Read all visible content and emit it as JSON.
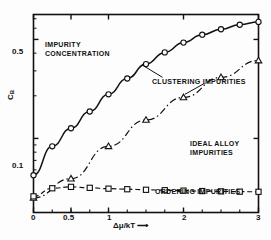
{
  "chart_data": {
    "type": "line",
    "title": "",
    "annotations": [
      {
        "id": "impurity-concentration",
        "text_line1": "IMPURITY",
        "text_line2": "CONCENTRATION",
        "x": 45,
        "y": 40
      },
      {
        "id": "clustering-impurities",
        "text_line1": "CLUSTERING IMPURITIES",
        "text_line2": "",
        "x": 152,
        "y": 77
      },
      {
        "id": "ideal-alloy-impurities",
        "text_line1": "IDEAL ALLOY",
        "text_line2": "IMPURITIES",
        "x": 190,
        "y": 140
      },
      {
        "id": "ordering-impurities",
        "text_line1": "ORDERING IMPURITIES",
        "text_line2": "",
        "x": 155,
        "y": 187
      }
    ],
    "xlabel": "Δμ/kT ⟶",
    "ylabel": "C",
    "ylabel_sub": "B",
    "xlim": [
      0,
      3
    ],
    "ylim_log": [
      0.03,
      0.75
    ],
    "yscale": "log",
    "xticks": [
      0,
      0.5,
      1,
      2,
      3
    ],
    "xtick_labels": [
      "0",
      "0.5",
      "1",
      "2",
      "3"
    ],
    "yticks": [
      0.1,
      0.5
    ],
    "ytick_labels": [
      "0.1",
      "0.5"
    ],
    "grid": false,
    "legend": "none (inline annotations)",
    "series": [
      {
        "name": "CLUSTERING IMPURITIES",
        "marker": "circle",
        "linestyle": "solid",
        "x": [
          0.0,
          0.25,
          0.5,
          0.75,
          1.0,
          1.25,
          1.5,
          1.75,
          2.0,
          2.25,
          2.5,
          2.75,
          3.0
        ],
        "y": [
          0.055,
          0.088,
          0.118,
          0.155,
          0.205,
          0.265,
          0.335,
          0.405,
          0.475,
          0.54,
          0.59,
          0.635,
          0.665
        ]
      },
      {
        "name": "IDEAL ALLOY IMPURITIES",
        "marker": "triangle",
        "linestyle": "dashdot",
        "x": [
          0.0,
          0.5,
          1.0,
          1.5,
          2.0,
          2.5,
          3.0
        ],
        "y": [
          0.038,
          0.052,
          0.088,
          0.135,
          0.195,
          0.27,
          0.355
        ]
      },
      {
        "name": "ORDERING IMPURITIES",
        "marker": "square",
        "linestyle": "dashed",
        "x": [
          0.0,
          0.25,
          0.5,
          0.75,
          1.0,
          1.25,
          1.5,
          1.75,
          2.0,
          2.25,
          2.5,
          2.75,
          3.0
        ],
        "y": [
          0.039,
          0.0445,
          0.0455,
          0.0448,
          0.0442,
          0.0438,
          0.0434,
          0.0431,
          0.0428,
          0.0425,
          0.0423,
          0.0421,
          0.042
        ]
      }
    ],
    "colors": {
      "line": "#111111",
      "background": "#fdfdfd",
      "frame": "#111111"
    }
  }
}
